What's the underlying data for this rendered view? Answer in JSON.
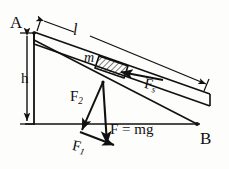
{
  "figure": {
    "type": "physics-diagram",
    "background_color": "#fdfdfc",
    "line_color": "#111111"
  },
  "labels": {
    "point_a": "A",
    "point_b": "B",
    "height": "h",
    "length": "l",
    "mass": "m",
    "force_s": "F",
    "force_s_sub": "s",
    "force_2": "F",
    "force_2_sub": "2",
    "force_1": "F",
    "force_1_sub": "1",
    "weight": "F = mg"
  },
  "geometry": {
    "apex_a": [
      34,
      32
    ],
    "base_b": [
      197,
      125
    ],
    "incline_top_start": [
      34,
      32
    ],
    "incline_top_end": [
      209,
      94
    ],
    "incline_bottom_start": [
      34,
      44
    ],
    "incline_bottom_end": [
      209,
      106
    ],
    "ground_line_y": 124,
    "ground_line_x_start": [
      25,
      124
    ],
    "ground_line_x_end": [
      200,
      124
    ],
    "block_center": [
      112,
      62
    ],
    "vector_origin": [
      103,
      82
    ],
    "dim_l_start": [
      41,
      20
    ],
    "dim_l_end": [
      207,
      84
    ],
    "dim_h_top": [
      34,
      33
    ],
    "dim_h_bottom": [
      34,
      124
    ]
  },
  "vectors": [
    {
      "name": "F_s",
      "from": [
        160,
        79
      ],
      "to": [
        118,
        72
      ],
      "description": "force up the incline toward block"
    },
    {
      "name": "F_2",
      "from": [
        103,
        82
      ],
      "to": [
        80,
        132
      ],
      "description": "normal-ish component down-left"
    },
    {
      "name": "F_1",
      "from": [
        80,
        132
      ],
      "to": [
        118,
        146
      ],
      "description": "component arrow to weight tip"
    },
    {
      "name": "F_mg",
      "from": [
        103,
        82
      ],
      "to": [
        107,
        147
      ],
      "description": "weight vertical downward"
    }
  ]
}
